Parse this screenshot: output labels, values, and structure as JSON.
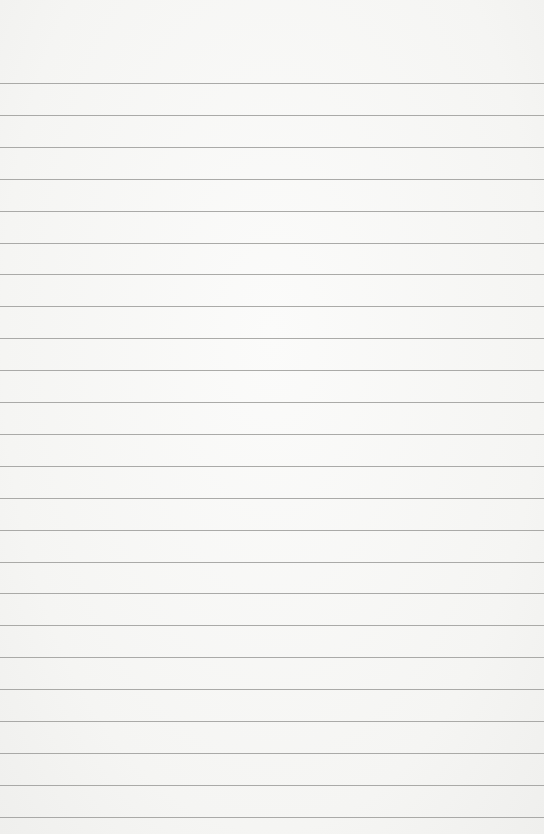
{
  "page": {
    "type": "lined-paper",
    "background_color": "#f7f7f5",
    "line_color": "#9c9c9a",
    "first_line_y": 83,
    "line_spacing": 31.9,
    "line_count": 24,
    "text": ""
  }
}
